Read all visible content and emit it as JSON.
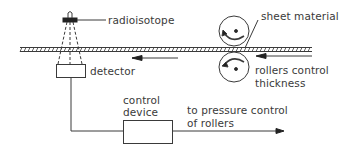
{
  "diagram": {
    "labels": {
      "radioisotope": "radioisotope",
      "sheet_material": "sheet material",
      "detector": "detector",
      "rollers_line1": "rollers control",
      "rollers_line2": "thickness",
      "control_line1": "control",
      "control_line2": "device",
      "output_line1": "to pressure control",
      "output_line2": "of rollers"
    },
    "colors": {
      "line": "#3a3a3a",
      "background": "#ffffff"
    }
  }
}
